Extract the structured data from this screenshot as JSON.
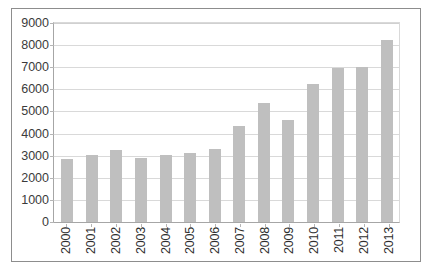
{
  "chart_data": {
    "type": "bar",
    "title": "",
    "xlabel": "",
    "ylabel": "",
    "categories": [
      "2000",
      "2001",
      "2002",
      "2003",
      "2004",
      "2005",
      "2006",
      "2007",
      "2008",
      "2009",
      "2010",
      "2011",
      "2012",
      "2013"
    ],
    "values": [
      2850,
      3010,
      3240,
      2900,
      3010,
      3110,
      3310,
      4330,
      5380,
      4620,
      6230,
      6950,
      7000,
      8250
    ],
    "series": [
      {
        "name": "",
        "values": [
          2850,
          3010,
          3240,
          2900,
          3010,
          3110,
          3310,
          4330,
          5380,
          4620,
          6230,
          6950,
          7000,
          8250
        ]
      }
    ],
    "ylim": [
      0,
      9000
    ],
    "y_ticks": [
      0,
      1000,
      2000,
      3000,
      4000,
      5000,
      6000,
      7000,
      8000,
      9000
    ],
    "y_tick_labels": [
      "0",
      "1000",
      "2000",
      "3000",
      "4000",
      "5000",
      "6000",
      "7000",
      "8000",
      "9000"
    ],
    "grid": true,
    "grid_axis": "y",
    "legend": false,
    "legend_position": "none",
    "bar_color": "#bfbfbf",
    "gridline_color": "#d9d9d9",
    "axis_color": "#a6a6a6",
    "frame_border_color": "#8d8d8d",
    "background_color": "#ffffff",
    "x_label_rotation": -90
  }
}
